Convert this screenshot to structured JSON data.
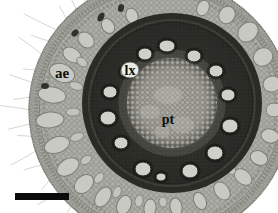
{
  "figure": {
    "alt": "Light micrograph of a plant root transverse section showing cortical aerenchyma, a central stele with a ring of large white metaxylem vessels, and pith; black scale bar at lower left",
    "background": "#ffffff",
    "labels": [
      {
        "id": "ae",
        "text": "ae",
        "x": 62,
        "y": 78,
        "size": 15
      },
      {
        "id": "lx",
        "text": "lx",
        "x": 130,
        "y": 75,
        "size": 14
      },
      {
        "id": "pt",
        "text": "pt",
        "x": 168,
        "y": 124,
        "size": 14
      }
    ],
    "lx_halo": {
      "x": 130,
      "y": 70,
      "rx": 9,
      "ry": 8
    },
    "scale_bar": {
      "x": 15,
      "y": 193,
      "w": 54,
      "h": 7,
      "color": "#0b0b0b"
    },
    "root": {
      "cx": 160,
      "cy": 110,
      "r": 131
    },
    "stele": {
      "cx": 172,
      "cy": 103,
      "r": 90
    },
    "colors": {
      "cortex": "#d0d0c9",
      "stele_rim": "#34342e",
      "stele_body": "#595952",
      "pith": "#c9c9c0",
      "lacuna": "#f2f2ec",
      "vessel": "#fafaf5",
      "hair": "#c6c6c0"
    },
    "vessels": [
      [
        167,
        46,
        8,
        6
      ],
      [
        145,
        54,
        7,
        6
      ],
      [
        194,
        56,
        7,
        6
      ],
      [
        216,
        71,
        7,
        6
      ],
      [
        228,
        95,
        7,
        6
      ],
      [
        230,
        126,
        8,
        7
      ],
      [
        215,
        153,
        8,
        7
      ],
      [
        190,
        171,
        8,
        7
      ],
      [
        161,
        177,
        5,
        4
      ],
      [
        143,
        169,
        8,
        7
      ],
      [
        121,
        143,
        7,
        6
      ],
      [
        108,
        118,
        8,
        7
      ],
      [
        110,
        92,
        7,
        6
      ],
      [
        126,
        72,
        6,
        5
      ]
    ],
    "lacunae_outer": [
      [
        62,
        73,
        13,
        9,
        21
      ],
      [
        52,
        95,
        14,
        8,
        8
      ],
      [
        50,
        120,
        14,
        8,
        175
      ],
      [
        57,
        145,
        13,
        8,
        161
      ],
      [
        68,
        167,
        12,
        8,
        148
      ],
      [
        84,
        184,
        11,
        8,
        136
      ],
      [
        103,
        197,
        11,
        7,
        123
      ],
      [
        124,
        205,
        10,
        7,
        111
      ],
      [
        150,
        208,
        9,
        6,
        96
      ],
      [
        176,
        207,
        9,
        6,
        81
      ],
      [
        200,
        201,
        9,
        6,
        66
      ],
      [
        222,
        191,
        10,
        7,
        53
      ],
      [
        243,
        177,
        10,
        7,
        39
      ],
      [
        259,
        158,
        9,
        7,
        26
      ],
      [
        270,
        136,
        9,
        7,
        13
      ],
      [
        274,
        110,
        8,
        7,
        0
      ],
      [
        272,
        84,
        9,
        8,
        -13
      ],
      [
        263,
        57,
        10,
        9,
        -27
      ],
      [
        248,
        32,
        11,
        9,
        -41
      ],
      [
        227,
        15,
        9,
        8,
        -55
      ],
      [
        203,
        8,
        8,
        6,
        -67
      ],
      [
        132,
        16,
        8,
        6,
        73
      ],
      [
        108,
        26,
        8,
        6,
        58
      ],
      [
        86,
        40,
        9,
        7,
        43
      ],
      [
        72,
        55,
        10,
        7,
        32
      ]
    ],
    "lacunae_inner": [
      [
        82,
        62,
        6,
        4,
        37
      ],
      [
        76,
        86,
        7,
        4,
        17
      ],
      [
        73,
        112,
        7,
        4,
        178
      ],
      [
        77,
        137,
        7,
        4,
        161
      ],
      [
        86,
        160,
        6,
        4,
        146
      ],
      [
        99,
        178,
        6,
        4,
        131
      ],
      [
        117,
        192,
        6,
        4,
        114
      ],
      [
        139,
        201,
        6,
        4,
        99
      ],
      [
        163,
        202,
        5,
        4,
        85
      ],
      [
        231,
        170,
        5,
        4,
        40
      ],
      [
        252,
        120,
        5,
        4,
        8
      ],
      [
        249,
        75,
        5,
        4,
        -21
      ]
    ],
    "dark_specks": [
      [
        101,
        17,
        5,
        3,
        -60
      ],
      [
        75,
        33,
        4,
        3,
        -45
      ],
      [
        45,
        86,
        4,
        3,
        0
      ],
      [
        252,
        88,
        3,
        3,
        0
      ],
      [
        121,
        8,
        4,
        3,
        -75
      ]
    ],
    "pith_blobs": [
      [
        168,
        95,
        14,
        9
      ],
      [
        150,
        112,
        10,
        7
      ],
      [
        182,
        125,
        12,
        8
      ],
      [
        162,
        132,
        8,
        6
      ]
    ],
    "hairs": [
      [
        98,
        14,
        2
      ],
      [
        108,
        18,
        -3
      ],
      [
        117,
        12,
        2
      ],
      [
        125,
        22,
        3
      ],
      [
        133,
        16,
        -2
      ],
      [
        140,
        26,
        4
      ],
      [
        148,
        14,
        -3
      ],
      [
        155,
        20,
        2
      ],
      [
        162,
        30,
        -4
      ],
      [
        168,
        16,
        3
      ],
      [
        174,
        24,
        -2
      ],
      [
        180,
        34,
        3
      ],
      [
        186,
        18,
        -3
      ],
      [
        192,
        26,
        2
      ],
      [
        198,
        14,
        -2
      ],
      [
        205,
        30,
        4
      ],
      [
        212,
        20,
        -3
      ],
      [
        218,
        38,
        -5
      ],
      [
        224,
        16,
        3
      ],
      [
        230,
        42,
        6
      ],
      [
        236,
        24,
        -4
      ],
      [
        242,
        34,
        5
      ],
      [
        248,
        18,
        -2
      ],
      [
        255,
        28,
        4
      ],
      [
        262,
        14,
        -3
      ],
      [
        270,
        20,
        3
      ],
      [
        278,
        12,
        -2
      ]
    ]
  }
}
